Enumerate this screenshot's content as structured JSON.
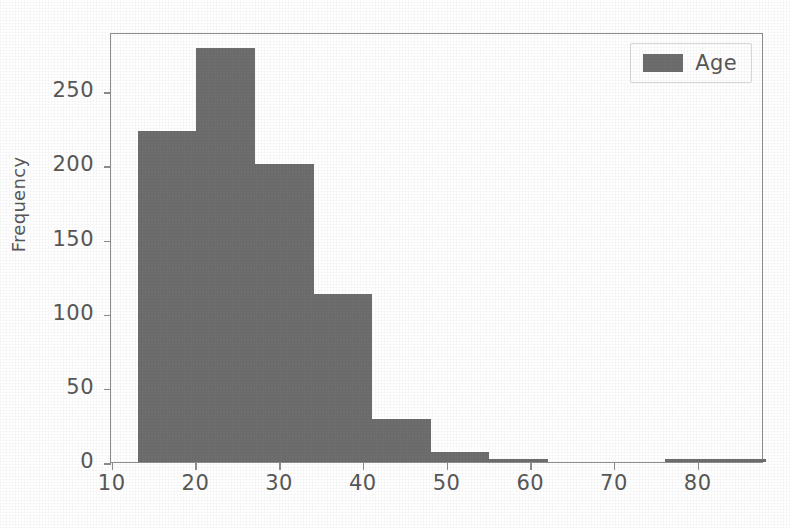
{
  "chart_data": {
    "type": "bar",
    "title": "",
    "subtitle": "",
    "xlabel": "",
    "ylabel": "Frequency",
    "grid": false,
    "legend_position": "top-right",
    "series": [
      {
        "name": "Age",
        "color": "#6e6e6e",
        "bin_edges": [
          13,
          20,
          27,
          34,
          41,
          48,
          55,
          62,
          69,
          76,
          83,
          88
        ],
        "values": [
          223,
          279,
          201,
          113,
          29,
          7,
          2,
          0,
          0,
          2,
          2
        ]
      }
    ],
    "bin_centers": [
      16.5,
      23.5,
      30.5,
      37.5,
      44.5,
      51.5,
      58.5,
      65.5,
      72.5,
      79.5,
      85.5
    ],
    "xlim": [
      9.8,
      87.8
    ],
    "ylim": [
      0,
      290
    ],
    "xticks": [
      10,
      20,
      30,
      40,
      50,
      60,
      70,
      80
    ],
    "xtick_labels": [
      "10",
      "20",
      "30",
      "40",
      "50",
      "60",
      "70",
      "80"
    ],
    "yticks": [
      0,
      50,
      100,
      150,
      200,
      250
    ],
    "ytick_labels": [
      "0",
      "50",
      "100",
      "150",
      "200",
      "250"
    ],
    "annotations": []
  },
  "legend": {
    "entries": [
      {
        "label": "Age",
        "color": "#6e6e6e",
        "swatch_name": "legend-swatch-age"
      }
    ]
  },
  "axes": {
    "y_axis_title": "Frequency",
    "x_axis_title": ""
  },
  "colors": {
    "bar": "#6e6e6e",
    "axis": "#8d8d8d",
    "text": "#585858",
    "background": "#ffffff"
  }
}
